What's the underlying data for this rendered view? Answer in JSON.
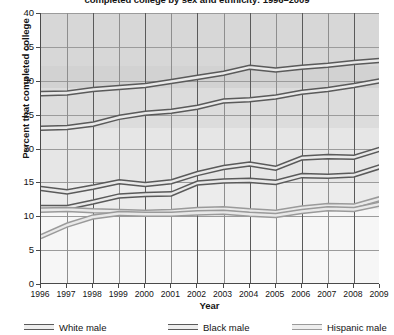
{
  "chart": {
    "title": "completed college by sex and ethnicity: 1996–2009",
    "xlabel": "Year",
    "ylabel": "Percent that completed college"
  },
  "axis": {
    "y_ticks": [
      "0",
      "5",
      "10",
      "15",
      "20",
      "25",
      "30",
      "35",
      "40"
    ],
    "x_ticks": [
      "1996",
      "1997",
      "1998",
      "1999",
      "2000",
      "2001",
      "2002",
      "2003",
      "2004",
      "2005",
      "2006",
      "2007",
      "2008",
      "2009"
    ]
  },
  "legend": {
    "items": [
      {
        "label": "White male",
        "color": "#5a5a5a"
      },
      {
        "label": "Black male",
        "color": "#5a5a5a"
      },
      {
        "label": "Hispanic male",
        "color": "#9a9a9a"
      }
    ]
  },
  "chart_data": {
    "type": "line",
    "title": "completed college by sex and ethnicity: 1996–2009",
    "xlabel": "Year",
    "ylabel": "Percent that completed college",
    "ylim": [
      0,
      40
    ],
    "yticks": [
      0,
      5,
      10,
      15,
      20,
      25,
      30,
      35,
      40
    ],
    "grid": true,
    "legend_position": "bottom",
    "x": [
      1996,
      1997,
      1998,
      1999,
      2000,
      2001,
      2002,
      2003,
      2004,
      2005,
      2006,
      2007,
      2008,
      2009
    ],
    "series": [
      {
        "name": "White male",
        "color": "#5a5a5a",
        "band": true,
        "upper": [
          28.4,
          28.5,
          29.0,
          29.3,
          29.6,
          30.2,
          30.8,
          31.4,
          32.3,
          31.9,
          32.3,
          32.6,
          33.0,
          33.3
        ],
        "lower": [
          27.8,
          27.9,
          28.4,
          28.7,
          29.0,
          29.6,
          30.2,
          30.8,
          31.7,
          31.3,
          31.7,
          32.0,
          32.4,
          32.7
        ],
        "values": [
          28.1,
          28.2,
          28.7,
          29.0,
          29.3,
          29.9,
          30.5,
          31.1,
          32.0,
          31.6,
          32.0,
          32.3,
          32.7,
          33.0
        ]
      },
      {
        "name": "White male (second)",
        "color": "#5a5a5a",
        "band": true,
        "upper": [
          23.3,
          23.4,
          23.9,
          24.9,
          25.5,
          25.8,
          26.4,
          27.3,
          27.5,
          27.9,
          28.6,
          29.0,
          29.6,
          30.3
        ],
        "lower": [
          22.7,
          22.8,
          23.3,
          24.3,
          24.9,
          25.2,
          25.8,
          26.7,
          26.9,
          27.3,
          28.0,
          28.4,
          29.0,
          29.7
        ],
        "values": [
          23.0,
          23.1,
          23.6,
          24.6,
          25.2,
          25.5,
          26.1,
          27.0,
          27.2,
          27.6,
          28.3,
          28.7,
          29.3,
          30.0
        ]
      },
      {
        "name": "Black male",
        "color": "#5a5a5a",
        "band": true,
        "upper": [
          14.4,
          13.9,
          14.6,
          15.4,
          15.0,
          15.4,
          16.6,
          17.5,
          18.0,
          17.4,
          18.9,
          19.1,
          19.0,
          20.2
        ],
        "lower": [
          13.8,
          13.3,
          14.0,
          14.8,
          14.4,
          14.8,
          16.0,
          16.9,
          17.4,
          16.8,
          18.3,
          18.5,
          18.4,
          19.6
        ],
        "values": [
          14.1,
          13.6,
          14.3,
          15.1,
          14.7,
          15.1,
          16.3,
          17.2,
          17.7,
          17.1,
          18.6,
          18.8,
          18.7,
          19.9
        ]
      },
      {
        "name": "Black male (second)",
        "color": "#5a5a5a",
        "band": true,
        "upper": [
          11.6,
          11.6,
          12.4,
          13.3,
          13.5,
          13.6,
          15.2,
          15.5,
          15.6,
          15.3,
          16.3,
          16.2,
          16.4,
          17.6
        ],
        "lower": [
          11.0,
          11.0,
          11.8,
          12.7,
          12.9,
          13.0,
          14.6,
          14.9,
          15.0,
          14.7,
          15.7,
          15.6,
          15.8,
          17.0
        ],
        "values": [
          11.3,
          11.3,
          12.1,
          13.0,
          13.2,
          13.3,
          14.9,
          15.2,
          15.3,
          15.0,
          16.0,
          15.9,
          16.1,
          17.3
        ]
      },
      {
        "name": "Hispanic male",
        "color": "#9a9a9a",
        "band": true,
        "upper": [
          11.2,
          11.3,
          11.1,
          11.0,
          10.9,
          11.0,
          11.3,
          11.4,
          11.1,
          10.9,
          11.5,
          11.9,
          11.8,
          12.9
        ],
        "lower": [
          10.6,
          10.7,
          10.5,
          10.4,
          10.3,
          10.4,
          10.7,
          10.8,
          10.5,
          10.3,
          10.9,
          11.3,
          11.2,
          12.3
        ],
        "values": [
          10.9,
          11.0,
          10.8,
          10.7,
          10.6,
          10.7,
          11.0,
          11.1,
          10.8,
          10.6,
          11.2,
          11.6,
          11.5,
          12.6
        ]
      },
      {
        "name": "Hispanic male (second)",
        "color": "#9a9a9a",
        "band": true,
        "upper": [
          7.3,
          9.0,
          10.2,
          10.7,
          10.6,
          10.6,
          10.8,
          10.9,
          10.6,
          10.4,
          11.0,
          11.4,
          11.3,
          12.1
        ],
        "lower": [
          6.7,
          8.4,
          9.6,
          10.1,
          10.0,
          10.0,
          10.2,
          10.3,
          10.0,
          9.8,
          10.4,
          10.8,
          10.7,
          11.5
        ],
        "values": [
          7.0,
          8.7,
          9.9,
          10.4,
          10.3,
          10.3,
          10.5,
          10.6,
          10.3,
          10.1,
          10.7,
          11.1,
          11.0,
          11.8
        ]
      }
    ]
  }
}
